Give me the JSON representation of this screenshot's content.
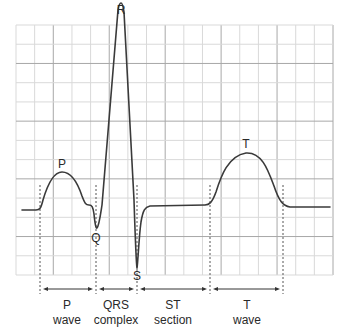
{
  "diagram": {
    "grid": {
      "x0": 16,
      "x1": 333,
      "y0": 25,
      "y1": 275,
      "cols": 17,
      "rows": 13,
      "minor_color": "#d9d9d9",
      "major_color": "#a8a8a8",
      "major_every": 3
    },
    "trace_color": "#3a3a3a",
    "peak_labels": [
      {
        "id": "P",
        "text": "P",
        "x": 62,
        "y": 158
      },
      {
        "id": "Q",
        "text": "Q",
        "x": 96,
        "y": 232
      },
      {
        "id": "R",
        "text": "R",
        "x": 121,
        "y": 4
      },
      {
        "id": "S",
        "text": "S",
        "x": 137,
        "y": 270
      },
      {
        "id": "T",
        "text": "T",
        "x": 246,
        "y": 138
      }
    ],
    "segments": [
      {
        "id": "p-wave",
        "line1": "P",
        "line2": "wave",
        "x": 67,
        "from": 40,
        "to": 96
      },
      {
        "id": "qrs-complex",
        "line1": "QRS",
        "line2": "complex",
        "x": 116,
        "from": 96,
        "to": 137
      },
      {
        "id": "st-section",
        "line1": "ST",
        "line2": "section",
        "x": 173,
        "from": 137,
        "to": 210
      },
      {
        "id": "t-wave",
        "line1": "T",
        "line2": "wave",
        "x": 247,
        "from": 210,
        "to": 283
      }
    ],
    "dividers_x": [
      40,
      96,
      137,
      210,
      283
    ]
  }
}
